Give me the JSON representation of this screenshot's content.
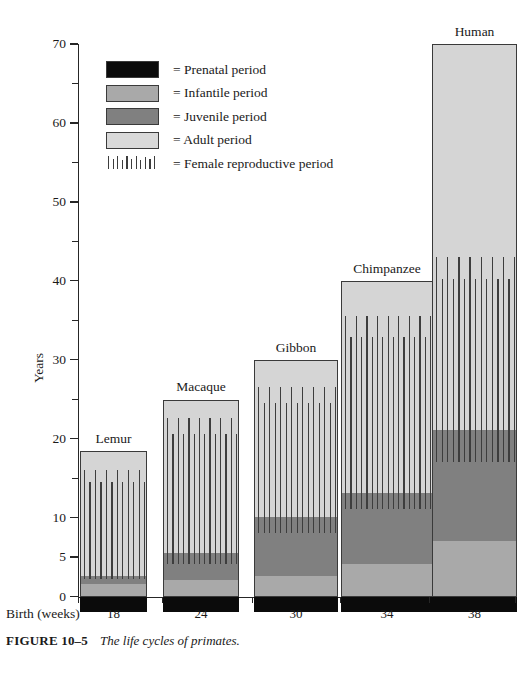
{
  "figure": {
    "number_label": "FIGURE 10–5",
    "caption": "The life cycles of primates.",
    "y_axis_title": "Years",
    "x_axis_title": "Birth (weeks)"
  },
  "legend": {
    "items": [
      {
        "key": "prenatal",
        "swatch": "prenatal-swatch",
        "label": "= Prenatal period",
        "color": "#0b0b0b"
      },
      {
        "key": "infantile",
        "swatch": "infantile-swatch",
        "label": "= Infantile period",
        "color": "#a9a9a9"
      },
      {
        "key": "juvenile",
        "swatch": "juvenile-swatch",
        "label": "= Juvenile period",
        "color": "#808080"
      },
      {
        "key": "adult",
        "swatch": "adult-swatch",
        "label": "= Adult period",
        "color": "#d9d9d9"
      },
      {
        "key": "repro",
        "swatch": "repro-hatch-icon",
        "label": "= Female reproductive period",
        "color": "#3d3d3d"
      }
    ]
  },
  "chart_data": {
    "type": "bar",
    "title": "The life cycles of primates.",
    "xlabel": "Birth (weeks)",
    "ylabel": "Years",
    "ylim": [
      0,
      70
    ],
    "yticks": [
      0,
      5,
      10,
      20,
      30,
      40,
      50,
      60,
      70
    ],
    "yticks_minor": [
      15,
      25,
      35,
      45,
      55,
      65
    ],
    "ytick_labels": [
      "0",
      "5",
      "10",
      "20",
      "30",
      "40",
      "50",
      "60",
      "70"
    ],
    "grid": false,
    "legend_position": "upper-left-inside",
    "stacked": true,
    "categories": [
      "Lemur",
      "Macaque",
      "Gibbon",
      "Chimpanzee",
      "Human"
    ],
    "xtick_labels": [
      "18",
      "24",
      "30",
      "34",
      "38"
    ],
    "xtick_unit": "weeks",
    "series": [
      {
        "name": "Prenatal period",
        "values": [
          0.35,
          0.46,
          0.58,
          0.65,
          0.73
        ],
        "note": "gestation drawn below the zero line, labeled in weeks"
      },
      {
        "name": "Infantile period",
        "values": [
          1.5,
          2.0,
          2.5,
          4.0,
          7.0
        ]
      },
      {
        "name": "Juvenile period",
        "values": [
          1.0,
          3.5,
          7.5,
          9.0,
          14.0
        ]
      },
      {
        "name": "Adult period",
        "values": [
          16.0,
          19.5,
          20.0,
          27.0,
          49.0
        ]
      }
    ],
    "totals": [
      18.5,
      25.0,
      30.0,
      40.0,
      70.0
    ],
    "stage_boundaries": [
      {
        "category": "Lemur",
        "infantile_end": 1.5,
        "juvenile_end": 2.5,
        "lifespan": 18.5
      },
      {
        "category": "Macaque",
        "infantile_end": 2.0,
        "juvenile_end": 5.5,
        "lifespan": 25.0
      },
      {
        "category": "Gibbon",
        "infantile_end": 2.5,
        "juvenile_end": 10.0,
        "lifespan": 30.0
      },
      {
        "category": "Chimpanzee",
        "infantile_end": 4.0,
        "juvenile_end": 13.0,
        "lifespan": 40.0
      },
      {
        "category": "Human",
        "infantile_end": 7.0,
        "juvenile_end": 21.0,
        "lifespan": 70.0
      }
    ],
    "female_reproductive_period": [
      {
        "category": "Lemur",
        "start": 2.2,
        "end": 16.0
      },
      {
        "category": "Macaque",
        "start": 4.0,
        "end": 22.5
      },
      {
        "category": "Gibbon",
        "start": 8.0,
        "end": 26.5
      },
      {
        "category": "Chimpanzee",
        "start": 11.0,
        "end": 35.5
      },
      {
        "category": "Human",
        "start": 17.0,
        "end": 43.0
      }
    ]
  }
}
